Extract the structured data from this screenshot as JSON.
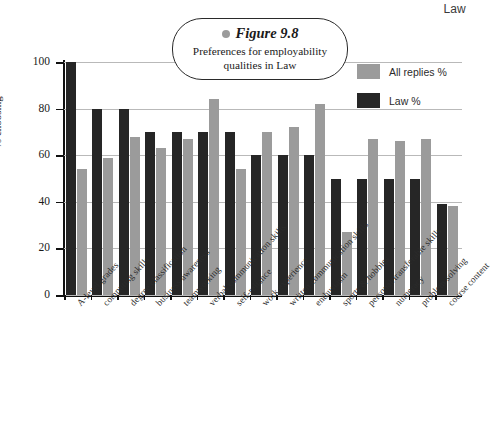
{
  "page": {
    "header_label": "Law"
  },
  "figure": {
    "dot_icon": "bullet-dot",
    "number_label": "Figure 9.8",
    "caption_line1": "Preferences for employability",
    "caption_line2": "qualities in Law"
  },
  "legend": {
    "position": "top-right",
    "items": [
      {
        "label": "All replies %",
        "color": "#9b9b9b"
      },
      {
        "label": "Law %",
        "color": "#262626"
      }
    ]
  },
  "chart_data": {
    "type": "bar",
    "title": "Preferences for employability qualities in Law",
    "xlabel": "",
    "ylabel": "% choosing",
    "ylim": [
      0,
      100
    ],
    "yticks": [
      0,
      20,
      40,
      60,
      80,
      100
    ],
    "ytick_labels": [
      "0",
      "20",
      "40",
      "60",
      "80",
      "100"
    ],
    "grid": true,
    "legend_position": "top-right",
    "categories": [
      "A-level grades",
      "computing skills",
      "degree classification",
      "business awareness",
      "teamworking",
      "verbal communication skills",
      "self-reliance",
      "work experience",
      "written communication skills",
      "enthusiasm",
      "sports & hobbies",
      "personal/transferable skills",
      "numeracy",
      "problem solving",
      "course content"
    ],
    "series": [
      {
        "name": "Law %",
        "color": "#262626",
        "values": [
          100,
          80,
          80,
          70,
          70,
          70,
          70,
          60,
          60,
          60,
          50,
          50,
          50,
          50,
          39
        ]
      },
      {
        "name": "All replies %",
        "color": "#9b9b9b",
        "values": [
          54,
          59,
          68,
          63,
          67,
          84,
          54,
          70,
          72,
          82,
          27,
          67,
          66,
          67,
          38
        ]
      }
    ]
  }
}
